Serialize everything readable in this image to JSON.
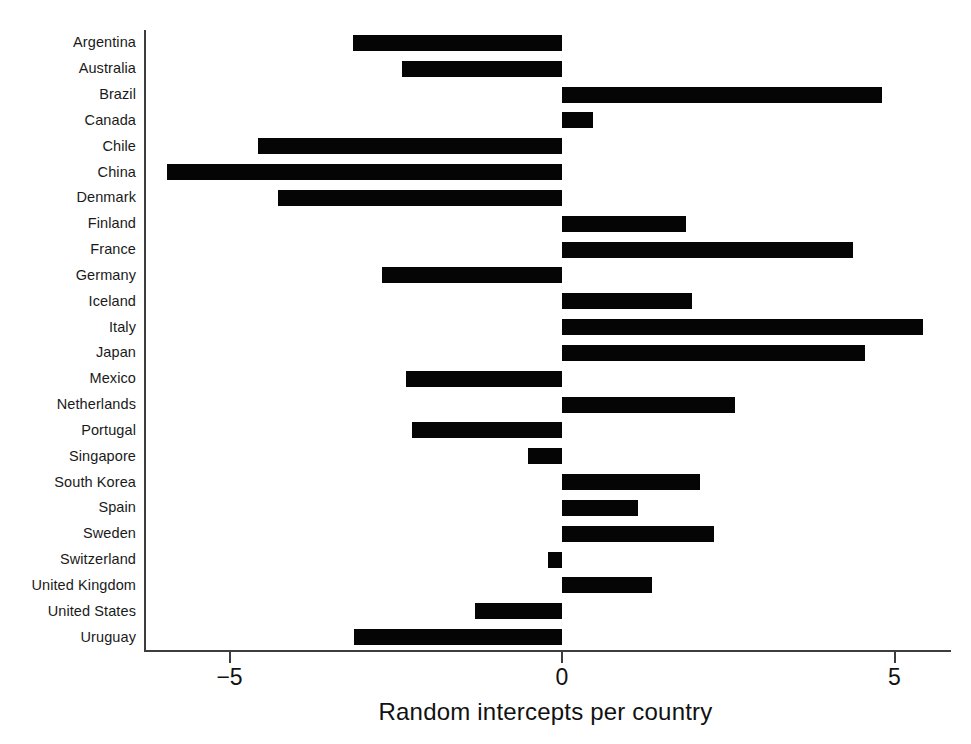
{
  "chart_data": {
    "type": "bar",
    "orientation": "horizontal",
    "title": "",
    "subtitle": "",
    "xlabel": "Random intercepts per country",
    "ylabel": "",
    "categories": [
      "Argentina",
      "Australia",
      "Brazil",
      "Canada",
      "Chile",
      "China",
      "Denmark",
      "Finland",
      "France",
      "Germany",
      "Iceland",
      "Italy",
      "Japan",
      "Mexico",
      "Netherlands",
      "Portugal",
      "Singapore",
      "South Korea",
      "Spain",
      "Sweden",
      "Switzerland",
      "United Kingdom",
      "United States",
      "Uruguay"
    ],
    "values": [
      -3.14,
      -2.4,
      4.81,
      0.47,
      -4.57,
      -5.94,
      -4.27,
      1.86,
      4.38,
      -2.7,
      1.95,
      5.43,
      4.56,
      -2.34,
      2.6,
      -2.26,
      -0.51,
      2.08,
      1.14,
      2.29,
      -0.21,
      1.35,
      -1.31,
      -3.13
    ],
    "xticks": [
      -5,
      0,
      5
    ],
    "xtick_labels": [
      "−5",
      "0",
      "5"
    ],
    "xlim": [
      -6.3,
      5.85
    ],
    "grid": false,
    "legend": false,
    "bar_color": "#050505",
    "axis_color": "#3d3d3d",
    "background": "#ffffff"
  },
  "axis": {
    "x_title": "Random intercepts per country"
  }
}
